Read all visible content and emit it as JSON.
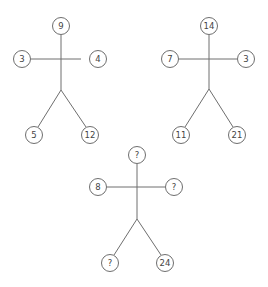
{
  "puzzle": {
    "figures": [
      {
        "id": "figure-1",
        "head": "9",
        "left_hand": "3",
        "right_hand": "4",
        "left_foot": "5",
        "right_foot": "12"
      },
      {
        "id": "figure-2",
        "head": "14",
        "left_hand": "7",
        "right_hand": "3",
        "left_foot": "11",
        "right_foot": "21"
      },
      {
        "id": "figure-3",
        "head": "?",
        "left_hand": "8",
        "right_hand": "?",
        "left_foot": "?",
        "right_foot": "24"
      }
    ]
  },
  "colors": {
    "line": "#6e6e6e",
    "text": "#444444",
    "background": "#ffffff"
  }
}
